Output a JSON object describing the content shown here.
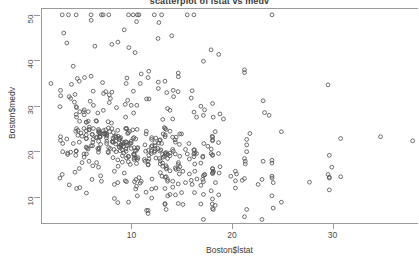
{
  "chart_data": {
    "type": "scatter",
    "title": "scatterplot of lstat vs medv",
    "xlabel": "Boston$lstat",
    "ylabel": "Boston$medv",
    "xlim": [
      1.0,
      38.5
    ],
    "ylim": [
      4.0,
      51.5
    ],
    "xticks": [
      10,
      20,
      30
    ],
    "yticks": [
      10,
      20,
      30,
      40,
      50
    ],
    "grid": false,
    "legend": null,
    "marker": "open-circle",
    "marker_color": "#555555",
    "background_color": "#ffffff",
    "n_points": 506,
    "x": [
      4.98,
      9.14,
      4.03,
      2.94,
      5.33,
      5.21,
      12.43,
      19.15,
      29.93,
      17.1,
      20.45,
      13.27,
      15.71,
      8.26,
      10.26,
      8.47,
      6.58,
      14.67,
      11.69,
      11.28,
      21.02,
      13.83,
      18.72,
      19.88,
      16.3,
      16.51,
      14.81,
      17.28,
      12.8,
      11.98,
      22.6,
      13.04,
      27.71,
      18.35,
      20.34,
      9.68,
      11.41,
      8.77,
      10.13,
      4.32,
      1.98,
      4.84,
      5.81,
      7.44,
      9.55,
      10.21,
      14.15,
      18.8,
      30.81,
      16.2,
      13.45,
      9.43,
      5.28,
      8.43,
      14.8,
      4.81,
      5.77,
      3.95,
      6.86,
      9.22,
      13.15,
      14.44,
      6.73,
      9.5,
      8.05,
      4.67,
      10.24,
      8.1,
      13.09,
      8.79,
      6.72,
      9.88,
      5.52,
      7.54,
      6.78,
      8.94,
      11.97,
      10.27,
      12.34,
      9.1,
      5.29,
      7.22,
      6.72,
      7.51,
      9.62,
      6.53,
      12.86,
      8.44,
      5.5,
      5.7,
      8.81,
      8.2,
      8.16,
      6.21,
      10.59,
      6.65,
      11.34,
      4.21,
      3.57,
      6.19,
      9.42,
      7.67,
      10.63,
      13.44,
      12.33,
      16.47,
      18.66,
      14.09,
      12.27,
      15.55,
      13.0,
      10.16,
      16.21,
      17.09,
      10.45,
      15.76,
      12.04,
      10.3,
      15.37,
      13.61,
      14.37,
      16.27,
      17.93,
      10.5,
      9.71,
      21.46,
      13.83,
      18.06,
      23.97,
      29.68,
      18.07,
      13.35,
      12.01,
      13.59,
      8.3,
      8.64,
      16.9,
      14.65,
      17.16,
      11.65,
      21.24,
      13.45,
      14.1,
      15.12,
      13.33,
      22.98,
      20.34,
      17.15,
      21.32,
      18.13,
      14.76,
      16.29,
      12.87,
      14.36,
      11.66,
      18.14,
      24.1,
      18.68,
      24.91,
      18.03,
      13.11,
      10.74,
      7.74,
      7.01,
      10.42,
      13.34,
      10.58,
      14.98,
      11.45,
      18.06,
      23.97,
      29.68,
      18.07,
      13.35,
      12.01,
      13.59,
      8.3,
      8.64,
      16.9,
      14.65,
      17.16,
      11.65,
      21.24,
      4.38,
      5.52,
      4.54,
      3.11,
      3.81,
      2.88,
      10.87,
      10.97,
      18.06,
      14.66,
      23.09,
      17.27,
      23.98,
      16.03,
      9.38,
      29.55,
      9.47,
      13.51,
      9.69,
      17.92,
      10.5,
      9.71,
      21.46,
      13.83,
      18.06,
      4.45,
      4.5,
      3.16,
      3.65,
      2.94,
      4.5,
      6.07,
      9.5,
      8.67,
      4.86,
      6.93,
      8.93,
      6.47,
      7.53,
      4.54,
      9.97,
      12.64,
      5.98,
      11.72,
      7.9,
      9.28,
      11.5,
      18.33,
      15.94,
      10.36,
      12.73,
      7.2,
      6.87,
      7.7,
      11.74,
      6.12,
      5.08,
      6.15,
      12.79,
      9.97,
      7.34,
      9.09,
      12.43,
      7.83,
      5.68,
      6.75,
      8.01,
      9.8,
      10.56,
      8.51,
      9.74,
      9.29,
      5.49,
      8.65,
      7.18,
      4.61,
      10.53,
      12.67,
      6.36,
      5.99,
      5.89,
      5.98,
      5.49,
      7.79,
      4.5,
      8.05,
      5.57,
      17.6,
      13.27,
      11.48,
      12.67,
      7.79,
      14.19,
      10.19,
      14.64,
      5.29,
      7.12,
      14.0,
      13.33,
      3.26,
      3.73,
      2.96,
      9.53,
      8.88,
      34.77,
      37.97,
      13.44,
      23.24,
      21.24,
      23.69,
      21.78,
      17.19,
      16.22,
      14.1,
      12.92,
      14.33,
      13.83,
      5.81,
      4.81,
      5.5,
      7.44,
      9.55,
      10.21,
      14.15,
      18.8,
      30.81,
      16.2,
      13.45,
      9.43,
      5.28,
      8.43,
      14.8,
      4.81,
      5.77,
      3.95,
      6.86,
      9.22,
      13.15,
      14.44,
      6.73,
      9.5,
      8.05,
      4.67,
      10.24,
      8.1,
      13.09,
      8.79,
      6.72,
      9.88,
      5.52,
      7.54,
      6.78,
      8.94,
      11.97,
      10.27,
      12.34,
      9.1,
      5.29,
      7.22,
      6.72,
      7.51,
      9.62,
      6.53,
      12.86,
      8.44,
      5.5,
      5.7,
      8.81,
      8.2,
      8.16,
      6.21,
      10.59,
      6.65,
      11.34,
      4.21,
      3.57,
      6.19,
      9.42,
      7.67,
      10.63,
      13.44,
      12.33,
      16.47,
      18.66,
      14.09,
      12.27,
      15.55,
      13.0,
      10.16,
      16.21,
      17.09,
      10.45,
      15.76,
      12.04,
      10.3,
      15.37,
      13.61,
      14.37,
      16.27,
      17.93,
      10.5,
      9.71,
      21.46,
      13.83,
      18.06,
      23.97,
      29.68,
      18.07,
      13.35,
      12.01,
      13.59,
      8.3,
      8.64,
      16.9,
      14.65,
      17.16,
      11.65,
      21.24,
      13.45,
      14.1,
      15.12,
      13.33,
      22.98,
      20.34,
      17.15,
      21.32,
      18.13,
      14.76,
      16.29,
      12.87,
      14.36,
      11.66,
      18.14,
      24.1,
      18.68,
      24.91,
      18.03,
      13.11,
      10.74,
      7.74,
      7.01,
      10.42,
      13.34,
      10.58,
      14.98,
      11.45,
      18.06,
      23.97,
      29.68,
      18.07,
      13.35,
      12.01,
      13.59,
      8.3,
      8.64,
      16.9,
      14.65,
      17.16,
      11.65,
      21.24,
      4.38,
      5.52,
      4.54,
      3.11,
      3.81,
      2.88,
      10.87,
      10.97,
      18.06,
      14.66,
      23.09,
      17.27,
      23.98,
      16.03,
      9.38,
      29.55,
      9.47,
      13.51,
      9.69,
      17.92,
      10.5,
      9.71,
      21.46,
      13.83,
      18.06,
      4.45,
      4.5,
      3.16,
      3.65,
      2.94,
      4.5,
      6.07,
      9.5,
      8.67,
      4.86,
      6.93,
      8.93,
      6.47,
      7.53,
      4.54,
      9.97,
      12.64,
      5.98,
      11.72,
      7.9,
      9.28,
      11.5,
      18.33,
      15.94,
      10.36,
      12.73,
      7.2,
      6.87,
      7.7,
      11.74,
      6.12,
      5.08,
      6.15,
      12.79,
      9.97,
      7.34,
      9.09,
      12.43,
      7.83,
      5.68
    ],
    "y": [
      24.0,
      21.6,
      34.7,
      33.4,
      36.2,
      28.7,
      22.9,
      27.1,
      16.5,
      18.9,
      15.0,
      18.9,
      21.7,
      20.4,
      18.2,
      19.9,
      23.1,
      17.5,
      20.2,
      18.2,
      13.6,
      19.6,
      15.2,
      14.5,
      15.6,
      13.9,
      16.6,
      14.8,
      18.4,
      21.0,
      12.7,
      14.5,
      13.2,
      13.1,
      13.5,
      18.9,
      20.0,
      21.0,
      24.7,
      30.8,
      34.9,
      26.6,
      25.3,
      24.7,
      21.2,
      19.3,
      20.0,
      16.6,
      14.4,
      19.4,
      19.7,
      20.5,
      25.0,
      23.4,
      18.9,
      35.4,
      24.7,
      31.6,
      23.3,
      19.6,
      18.7,
      16.0,
      22.2,
      25.0,
      33.0,
      23.5,
      19.4,
      22.0,
      17.4,
      20.9,
      24.2,
      21.7,
      22.8,
      23.4,
      24.1,
      21.4,
      20.0,
      20.8,
      21.2,
      20.3,
      28.0,
      23.9,
      24.8,
      22.9,
      23.9,
      26.6,
      22.5,
      22.2,
      23.6,
      28.7,
      22.6,
      22.0,
      22.9,
      25.0,
      20.6,
      28.4,
      21.4,
      38.7,
      43.8,
      33.2,
      27.5,
      26.5,
      18.6,
      19.3,
      20.1,
      19.5,
      19.5,
      20.4,
      19.8,
      19.4,
      21.7,
      22.8,
      18.8,
      18.7,
      18.5,
      18.3,
      21.2,
      19.2,
      20.4,
      19.3,
      22.0,
      20.3,
      20.5,
      17.3,
      18.8,
      21.4,
      15.7,
      16.2,
      18.0,
      14.3,
      19.2,
      19.6,
      23.0,
      18.4,
      15.6,
      18.1,
      17.4,
      17.1,
      13.3,
      17.8,
      14.0,
      14.4,
      13.4,
      15.6,
      11.8,
      13.8,
      15.6,
      14.6,
      17.8,
      15.4,
      21.5,
      19.6,
      15.3,
      19.4,
      17.0,
      15.6,
      13.1,
      41.3,
      24.3,
      23.3,
      27.0,
      50.0,
      50.0,
      50.0,
      22.7,
      25.0,
      50.0,
      23.8,
      23.8,
      22.3,
      17.4,
      19.1,
      23.1,
      23.6,
      22.6,
      29.4,
      23.2,
      24.6,
      29.9,
      37.2,
      39.8,
      36.2,
      37.9,
      32.5,
      26.4,
      29.6,
      50.0,
      32.0,
      29.8,
      34.9,
      37.0,
      30.5,
      36.4,
      31.1,
      29.1,
      50.0,
      33.3,
      30.3,
      34.6,
      34.9,
      32.9,
      24.1,
      42.3,
      48.5,
      50.0,
      22.6,
      24.4,
      22.5,
      24.4,
      20.0,
      21.7,
      19.3,
      22.4,
      28.1,
      23.7,
      25.0,
      23.3,
      28.7,
      21.5,
      23.0,
      26.7,
      21.7,
      27.5,
      30.1,
      44.8,
      50.0,
      37.6,
      31.6,
      46.7,
      31.5,
      24.3,
      31.7,
      41.7,
      48.3,
      29.0,
      24.0,
      25.1,
      31.5,
      23.7,
      23.3,
      22.0,
      20.1,
      22.2,
      23.7,
      17.6,
      18.5,
      24.3,
      20.5,
      24.5,
      26.2,
      24.4,
      24.8,
      29.6,
      42.8,
      21.9,
      20.9,
      44.0,
      50.0,
      36.0,
      30.1,
      33.8,
      43.1,
      48.8,
      31.0,
      36.5,
      22.8,
      30.7,
      50.0,
      43.5,
      20.7,
      21.1,
      25.2,
      24.4,
      35.2,
      32.4,
      32.0,
      33.2,
      33.1,
      29.1,
      35.1,
      45.4,
      35.4,
      46.0,
      50.0,
      32.2,
      22.0,
      20.1,
      23.2,
      22.3,
      24.8,
      28.5,
      37.3,
      27.9,
      23.9,
      21.7,
      28.6,
      27.1,
      20.3,
      22.5,
      29.0,
      24.8,
      22.0,
      26.4,
      33.1,
      36.1,
      28.4,
      33.4,
      28.2,
      22.8,
      20.3,
      16.1,
      22.1,
      19.4,
      21.6,
      23.8,
      16.2,
      17.8,
      19.8,
      23.1,
      21.0,
      23.8,
      23.1,
      20.4,
      18.5,
      25.0,
      24.6,
      23.0,
      22.2,
      19.3,
      22.6,
      19.8,
      17.1,
      19.4,
      22.2,
      20.7,
      21.1,
      19.5,
      18.5,
      20.6,
      19.0,
      18.7,
      32.7,
      16.5,
      23.9,
      31.2,
      17.5,
      17.2,
      23.1,
      24.5,
      26.6,
      22.9,
      24.1,
      18.6,
      30.1,
      18.2,
      20.6,
      17.8,
      21.7,
      22.7,
      22.6,
      25.0,
      19.9,
      20.8,
      16.8,
      21.9,
      27.5,
      21.9,
      23.1,
      50.0,
      50.0,
      50.0,
      50.0,
      50.0,
      13.8,
      13.8,
      15.0,
      13.9,
      13.3,
      13.1,
      10.2,
      10.4,
      10.9,
      11.3,
      12.3,
      8.8,
      7.2,
      10.5,
      7.4,
      10.2,
      11.5,
      15.1,
      23.2,
      9.7,
      13.8,
      12.7,
      13.1,
      12.5,
      8.5,
      5.0,
      6.3,
      5.6,
      7.2,
      12.1,
      8.3,
      8.5,
      5.0,
      11.9,
      27.9,
      17.2,
      27.5,
      15.0,
      17.2,
      17.9,
      16.3,
      7.0,
      7.2,
      7.5,
      10.4,
      8.8,
      8.4,
      16.7,
      14.2,
      20.8,
      13.4,
      11.7,
      8.3,
      10.2,
      10.9,
      11.0,
      9.5,
      14.5,
      14.1,
      16.1,
      14.3,
      11.7,
      13.4,
      9.6,
      8.7,
      8.4,
      12.8,
      10.5,
      17.1,
      18.4,
      15.4,
      10.8,
      11.8,
      14.9,
      12.6,
      14.1,
      13.0,
      13.4,
      15.2,
      16.1,
      17.8,
      14.9,
      14.1,
      12.7,
      13.5,
      14.9,
      20.0,
      16.4,
      17.7,
      19.5,
      20.2,
      21.4,
      19.9,
      19.0,
      19.1,
      19.1,
      20.1,
      19.9,
      19.6,
      23.2,
      29.8,
      13.8,
      13.3,
      16.7,
      12.0,
      14.6,
      21.4,
      23.0,
      23.7,
      25.0,
      21.8,
      20.6,
      21.2,
      19.1,
      20.6,
      15.2,
      7.0,
      8.1,
      13.6,
      20.1,
      21.8,
      24.5,
      23.1,
      19.7,
      18.3,
      21.2,
      17.5,
      16.8,
      22.4,
      20.6,
      23.9,
      22.0,
      11.9
    ]
  },
  "axis": {
    "y_tick_labels": [
      "10",
      "20",
      "30",
      "40",
      "50"
    ],
    "x_tick_labels": [
      "10",
      "20",
      "30"
    ]
  }
}
